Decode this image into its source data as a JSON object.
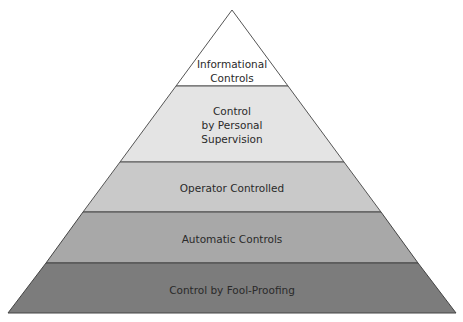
{
  "diagram": {
    "type": "pyramid",
    "levels": [
      {
        "lines": [
          "Informational",
          "Controls"
        ],
        "fill": "#ffffff"
      },
      {
        "lines": [
          "Control",
          "by Personal",
          "Supervision"
        ],
        "fill": "#e4e4e4"
      },
      {
        "lines": [
          "Operator Controlled"
        ],
        "fill": "#c9c9c9"
      },
      {
        "lines": [
          "Automatic Controls"
        ],
        "fill": "#a8a8a8"
      },
      {
        "lines": [
          "Control by Fool-Proofing"
        ],
        "fill": "#7c7c7c"
      }
    ],
    "outline_color": "#555555"
  }
}
